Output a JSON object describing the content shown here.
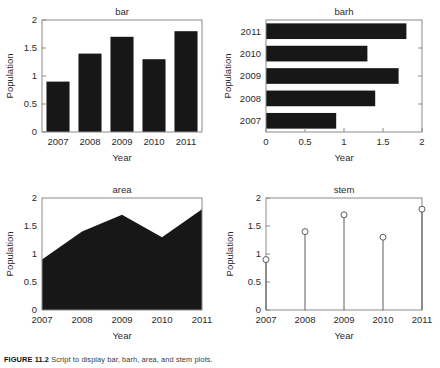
{
  "figure": {
    "caption_label": "FIGURE 11.2",
    "caption_text": "Script to display bar, barh, area, and stem plots.",
    "background_color": "#ffffff",
    "ink_color": "#171717",
    "axis_color": "#8a8a8a"
  },
  "chart_data": [
    {
      "id": "bar",
      "type": "bar",
      "title": "bar",
      "xlabel": "Year",
      "ylabel": "Population",
      "categories": [
        "2007",
        "2008",
        "2009",
        "2010",
        "2011"
      ],
      "values": [
        0.9,
        1.4,
        1.7,
        1.3,
        1.8
      ],
      "ylim": [
        0,
        2
      ],
      "yticks": [
        "0",
        "0.5",
        "1",
        "1.5",
        "2"
      ],
      "ytick_values": [
        0,
        0.5,
        1,
        1.5,
        2
      ],
      "grid": false,
      "legend": "none",
      "orientation": "vertical"
    },
    {
      "id": "barh",
      "type": "bar",
      "title": "barh",
      "xlabel": "Year",
      "ylabel": "Population",
      "categories": [
        "2007",
        "2008",
        "2009",
        "2010",
        "2011"
      ],
      "values": [
        0.9,
        1.4,
        1.7,
        1.3,
        1.8
      ],
      "xlim": [
        0,
        2
      ],
      "xticks": [
        "0",
        "0.5",
        "1",
        "1.5",
        "2"
      ],
      "xtick_values": [
        0,
        0.5,
        1,
        1.5,
        2
      ],
      "grid": false,
      "legend": "none",
      "orientation": "horizontal"
    },
    {
      "id": "area",
      "type": "area",
      "title": "area",
      "xlabel": "Year",
      "ylabel": "Population",
      "categories": [
        "2007",
        "2008",
        "2009",
        "2010",
        "2011"
      ],
      "values": [
        0.9,
        1.4,
        1.7,
        1.3,
        1.8
      ],
      "ylim": [
        0,
        2
      ],
      "yticks": [
        "0",
        "0.5",
        "1",
        "1.5",
        "2"
      ],
      "ytick_values": [
        0,
        0.5,
        1,
        1.5,
        2
      ],
      "grid": false,
      "legend": "none"
    },
    {
      "id": "stem",
      "type": "scatter",
      "title": "stem",
      "xlabel": "Year",
      "ylabel": "Population",
      "categories": [
        "2007",
        "2008",
        "2009",
        "2010",
        "2011"
      ],
      "values": [
        0.9,
        1.4,
        1.7,
        1.3,
        1.8
      ],
      "ylim": [
        0,
        2
      ],
      "yticks": [
        "0",
        "0.5",
        "1",
        "1.5",
        "2"
      ],
      "ytick_values": [
        0,
        0.5,
        1,
        1.5,
        2
      ],
      "grid": false,
      "legend": "none",
      "marker": "open-circle"
    }
  ]
}
